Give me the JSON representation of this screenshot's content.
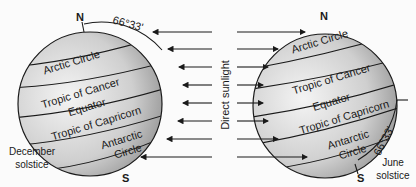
{
  "diagram": {
    "center_label": "Direct sunlight",
    "left_globe": {
      "caption_line1": "December",
      "caption_line2": "solstice",
      "north": "N",
      "south": "S",
      "angle": "66°33'",
      "latitudes": [
        "Arctic Circle",
        "Tropic of Cancer",
        "Equator",
        "Tropic of Capricorn",
        "Antarctic Circle"
      ]
    },
    "right_globe": {
      "caption_line1": "June",
      "caption_line2": "solstice",
      "north": "N",
      "south": "S",
      "angle": "66°33'",
      "latitudes": [
        "Arctic Circle",
        "Tropic of Cancer",
        "Equator",
        "Tropic of Capricorn",
        "Antarctic",
        "Circle"
      ]
    },
    "colors": {
      "globe_light": "#f2f2f2",
      "globe_dark": "#8a8a8a",
      "line": "#1a1a1a"
    }
  }
}
